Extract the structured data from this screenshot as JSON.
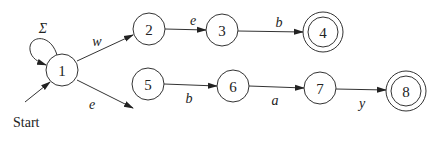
{
  "diagram": {
    "type": "nfa",
    "start_label": "Start",
    "states": [
      {
        "id": "1",
        "label": "1",
        "x": 62,
        "y": 70,
        "accepting": false
      },
      {
        "id": "2",
        "label": "2",
        "x": 149,
        "y": 29,
        "accepting": false
      },
      {
        "id": "3",
        "label": "3",
        "x": 222,
        "y": 30,
        "accepting": false
      },
      {
        "id": "4",
        "label": "4",
        "x": 323,
        "y": 32,
        "accepting": true
      },
      {
        "id": "5",
        "label": "5",
        "x": 148,
        "y": 84,
        "accepting": false
      },
      {
        "id": "6",
        "label": "6",
        "x": 233,
        "y": 86,
        "accepting": false
      },
      {
        "id": "7",
        "label": "7",
        "x": 320,
        "y": 88,
        "accepting": false
      },
      {
        "id": "8",
        "label": "8",
        "x": 406,
        "y": 91,
        "accepting": true
      }
    ],
    "transitions": [
      {
        "from": "1",
        "to": "1",
        "label": "Σ"
      },
      {
        "from": "1",
        "to": "2",
        "label": "w"
      },
      {
        "from": "2",
        "to": "3",
        "label": "e"
      },
      {
        "from": "3",
        "to": "4",
        "label": "b"
      },
      {
        "from": "1",
        "to": "5",
        "label": "e"
      },
      {
        "from": "5",
        "to": "6",
        "label": "b"
      },
      {
        "from": "6",
        "to": "7",
        "label": "a"
      },
      {
        "from": "7",
        "to": "8",
        "label": "y"
      }
    ],
    "colors": {
      "stroke": "#333333",
      "text": "#222222",
      "background": "#ffffff"
    }
  }
}
